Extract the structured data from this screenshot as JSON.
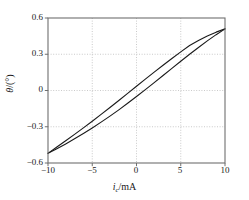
{
  "chart_data": {
    "type": "line",
    "title": "",
    "subtitle": "",
    "xlabel": "i_c/mA",
    "xlabel_symbol": "i",
    "xlabel_subscript": "c",
    "xlabel_unit": "/mA",
    "ylabel": "θ/(°)",
    "ylabel_symbol": "θ",
    "ylabel_unit": "/(°)",
    "xlim": [
      -10,
      10
    ],
    "ylim": [
      -0.6,
      0.6
    ],
    "xticks": [
      -10,
      -5,
      0,
      5,
      10
    ],
    "xtick_labels": [
      "−10",
      "−5",
      "0",
      "5",
      "10"
    ],
    "yticks": [
      -0.6,
      -0.3,
      0,
      0.3,
      0.6
    ],
    "ytick_labels": [
      "−0.6",
      "−0.3",
      "0",
      "0.3",
      "0.6"
    ],
    "grid": true,
    "grid_style": "dotted",
    "legend": "none",
    "line_color": "#1a1a1a",
    "line_width": 1.1,
    "series": [
      {
        "name": "upward sweep",
        "x": [
          -10,
          -9,
          -8,
          -7,
          -6,
          -5,
          -4,
          -3,
          -2,
          -1,
          0,
          1,
          2,
          3,
          4,
          5,
          6,
          7,
          8,
          9,
          10
        ],
        "y": [
          -0.52,
          -0.468,
          -0.416,
          -0.363,
          -0.309,
          -0.254,
          -0.198,
          -0.141,
          -0.083,
          -0.024,
          0.035,
          0.094,
          0.152,
          0.209,
          0.265,
          0.32,
          0.373,
          0.414,
          0.451,
          0.483,
          0.51
        ]
      },
      {
        "name": "downward sweep",
        "x": [
          -10,
          -9,
          -8,
          -7,
          -6,
          -5,
          -4,
          -3,
          -2,
          -1,
          0,
          1,
          2,
          3,
          4,
          5,
          6,
          7,
          8,
          9,
          10
        ],
        "y": [
          -0.52,
          -0.482,
          -0.442,
          -0.4,
          -0.356,
          -0.31,
          -0.262,
          -0.212,
          -0.16,
          -0.106,
          -0.05,
          0.007,
          0.065,
          0.124,
          0.183,
          0.242,
          0.3,
          0.356,
          0.411,
          0.462,
          0.51
        ]
      }
    ]
  },
  "figure": {
    "background_color": "#ffffff",
    "axis_color": "#6f6f6f",
    "grid_color": "#bdbdbd",
    "text_color": "#1a1a1a"
  }
}
